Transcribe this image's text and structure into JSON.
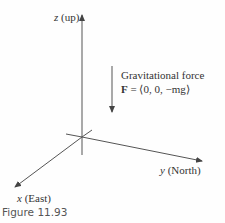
{
  "axes": {
    "z_label": "z (up)",
    "y_label": "y (North)",
    "x_label": "x (East)"
  },
  "force": {
    "title": "Gravitational force",
    "equation_bold": "F",
    "equation_rest": " = ⟨0, 0, −mg⟩"
  },
  "caption": "Figure 11.93",
  "colors": {
    "line": "#555555",
    "text": "#333333",
    "caption": "#555555"
  }
}
